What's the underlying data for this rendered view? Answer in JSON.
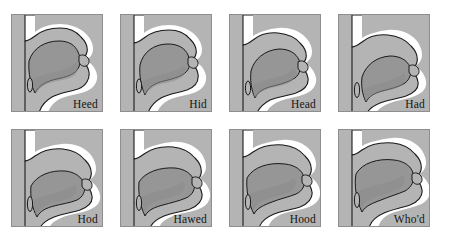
{
  "figure": {
    "type": "diagram-grid",
    "rows": 2,
    "columns": 4,
    "background_color": "#ffffff"
  },
  "colors": {
    "head_fill": "#b4b4b4",
    "airway_fill": "#ffffff",
    "tongue_fill": "#969696",
    "tongue_shade": "#8c8c8c",
    "outline": "#1a1a1a",
    "panel_border": "#8e8e8e",
    "label_color": "#141414"
  },
  "panels": [
    {
      "index": 1,
      "label": "Heed",
      "row": 1,
      "column": 1,
      "icon": "sagittal-vocal-tract-icon",
      "tongue_position": "high front",
      "tongue_body": "M 18 46 C 22 33 34 26 48 26 C 58 26 64 30 67 37 C 70 43 70 50 66 55 C 62 60 55 62 46 64 C 36 66 28 70 24 78 C 20 70 17 58 18 46 Z",
      "airway": "M 14 34 C 14 30 16 27 20 27 C 26 27 33 22 42 20 C 52 18 62 19 70 24 C 76 28 79 33 79 38 C 79 43 76 46 72 48 C 75 50 78 54 78 59 C 78 66 73 71 66 73 C 58 75 48 76 40 80 C 32 84 27 90 25 97 L 14 97 Z",
      "velum_state": "raised",
      "jaw": "closed"
    },
    {
      "index": 2,
      "label": "Hid",
      "row": 1,
      "column": 2,
      "icon": "sagittal-vocal-tract-icon",
      "tongue_position": "high-mid front",
      "tongue_body": "M 20 50 C 23 37 34 29 48 29 C 58 29 65 33 68 40 C 71 47 70 54 65 58 C 60 62 52 64 44 66 C 35 68 28 72 25 80 C 21 71 19 60 20 50 Z",
      "velum_state": "raised",
      "jaw": "slightly open"
    },
    {
      "index": 3,
      "label": "Head",
      "row": 1,
      "column": 3,
      "icon": "sagittal-vocal-tract-icon",
      "tongue_position": "mid front",
      "tongue_body": "M 22 56 C 25 44 36 35 50 34 C 60 34 67 38 70 45 C 73 52 71 59 66 63 C 60 67 52 69 44 71 C 36 73 29 76 26 83 C 22 74 21 65 22 56 Z",
      "velum_state": "raised",
      "jaw": "open"
    },
    {
      "index": 4,
      "label": "Had",
      "row": 1,
      "column": 4,
      "icon": "sagittal-vocal-tract-icon",
      "tongue_position": "low front",
      "tongue_body": "M 24 62 C 28 50 38 42 52 41 C 62 41 69 45 72 52 C 74 58 72 64 67 68 C 61 72 52 74 44 76 C 37 78 31 81 28 87 C 24 79 23 70 24 62 Z",
      "velum_state": "raised",
      "jaw": "wide open"
    },
    {
      "index": 5,
      "label": "Hod",
      "row": 2,
      "column": 1,
      "icon": "sagittal-vocal-tract-icon",
      "tongue_position": "low back",
      "tongue_body": "M 20 56 C 26 45 40 40 54 41 C 64 42 71 47 73 54 C 75 61 72 67 66 70 C 59 73 50 74 43 76 C 35 78 29 81 26 87 C 21 78 19 66 20 56 Z",
      "velum_state": "raised",
      "jaw": "wide open"
    },
    {
      "index": 6,
      "label": "Hawed",
      "row": 2,
      "column": 2,
      "icon": "sagittal-vocal-tract-icon",
      "tongue_position": "low-mid back",
      "tongue_body": "M 19 52 C 25 42 40 37 55 38 C 65 39 72 44 74 51 C 76 58 73 65 66 68 C 59 71 50 73 43 75 C 35 77 28 80 25 86 C 20 76 18 62 19 52 Z",
      "velum_state": "raised",
      "jaw": "open"
    },
    {
      "index": 7,
      "label": "Hood",
      "row": 2,
      "column": 3,
      "icon": "sagittal-vocal-tract-icon",
      "tongue_position": "high-mid back",
      "tongue_body": "M 18 48 C 24 37 40 32 56 34 C 66 35 73 40 75 47 C 77 54 74 61 67 64 C 60 67 50 69 43 72 C 35 75 28 78 25 84 C 19 73 17 58 18 48 Z",
      "velum_state": "raised",
      "jaw": "slightly open"
    },
    {
      "index": 8,
      "label": "Who'd",
      "row": 2,
      "column": 4,
      "icon": "sagittal-vocal-tract-icon",
      "tongue_position": "high back",
      "tongue_body": "M 18 44 C 24 33 40 28 56 30 C 66 31 73 36 75 43 C 77 50 74 57 67 61 C 60 64 50 67 43 70 C 35 73 27 76 24 82 C 18 70 16 54 18 44 Z",
      "velum_state": "raised",
      "jaw": "closed"
    }
  ]
}
